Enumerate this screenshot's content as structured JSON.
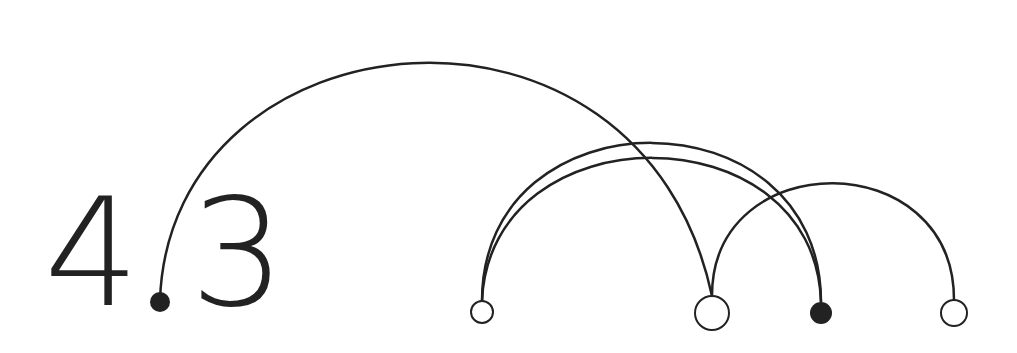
{
  "title": {
    "digit_left": "4",
    "digit_right": "3"
  },
  "colors": {
    "stroke": "#222222",
    "fill": "#ffffff"
  },
  "nodes": [
    {
      "id": "dot",
      "cx": 160,
      "cy": 302,
      "r": 10,
      "filled": true
    },
    {
      "id": "n1",
      "cx": 482,
      "cy": 312,
      "r": 11,
      "filled": false
    },
    {
      "id": "n2",
      "cx": 712,
      "cy": 313,
      "r": 17,
      "filled": false
    },
    {
      "id": "n3",
      "cx": 821,
      "cy": 313,
      "r": 11,
      "filled": true
    },
    {
      "id": "n4",
      "cx": 954,
      "cy": 313,
      "r": 13,
      "filled": false
    }
  ],
  "arcs": [
    {
      "from": "dot",
      "to": "n2",
      "peak_y": 32
    },
    {
      "from": "n1",
      "to": "n3",
      "peak_y": 128
    },
    {
      "from": "n1",
      "to": "n3",
      "peak_y": 139
    },
    {
      "from": "n2",
      "to": "n4",
      "peak_y": 180
    }
  ]
}
